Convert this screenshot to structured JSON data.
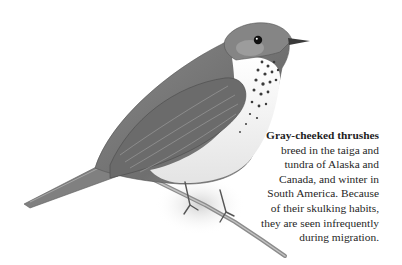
{
  "caption": {
    "lead": "Gray-cheeked thrushes",
    "lines": [
      "breed in the taiga and",
      "tundra of Alaska and",
      "Canada, and winter in",
      "South America. Because",
      "of their skulking habits,",
      "they are seen infrequently",
      "during migration."
    ]
  },
  "illustration": {
    "subject": "gray-cheeked thrush perched on branch",
    "palette": {
      "back": "#7a7a7a",
      "wing": "#6a6a6a",
      "belly": "#f2f2f2",
      "spots": "#3a3a3a",
      "eye": "#111111",
      "branch": "#8c8c8c"
    }
  }
}
